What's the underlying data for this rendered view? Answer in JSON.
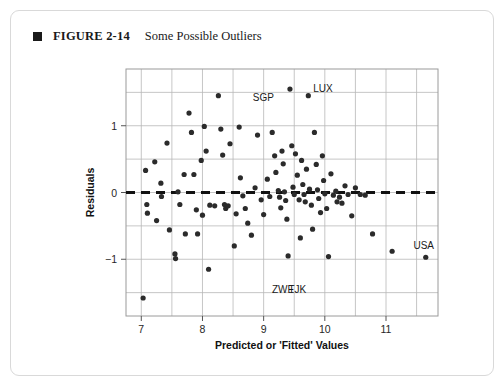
{
  "caption": {
    "bullet_icon": "filled-square-icon",
    "figure_number": "FIGURE 2-14",
    "title": "Some Possible Outliers"
  },
  "chart_data": {
    "type": "scatter",
    "title": "Some Possible Outliers",
    "xlabel": "Predicted or 'Fitted' Values",
    "ylabel": "Residuals",
    "xlim": [
      6.75,
      11.85
    ],
    "ylim": [
      -1.85,
      1.85
    ],
    "xticks": [
      7,
      8,
      9,
      10,
      11
    ],
    "xtick_labels": [
      "7",
      "8",
      "9",
      "10",
      "11"
    ],
    "yticks": [
      1,
      0,
      -1
    ],
    "ytick_labels": [
      "1",
      "0",
      "−1"
    ],
    "grid": true,
    "grid_step_x": 0.5,
    "grid_step_y": 0.5,
    "grid_color": "#b8b8b8",
    "point_color": "#2b2b2b",
    "reference_line": {
      "y": 0,
      "style": "dashed",
      "color": "#111111",
      "width": 3
    },
    "legend": "none",
    "annotations": [
      {
        "label": "SGP",
        "x": 9.43,
        "y": 1.55,
        "label_dx": -16,
        "label_dy": 12
      },
      {
        "label": "LUX",
        "x": 9.73,
        "y": 1.45,
        "label_dx": 5,
        "label_dy": -4
      },
      {
        "label": "USA",
        "x": 11.65,
        "y": -0.97,
        "label_dx": -2,
        "label_dy": -8
      },
      {
        "label": "ZWE",
        "x": 9.35,
        "y": -1.62,
        "label_dx": -2,
        "label_dy": -8
      },
      {
        "label": "TJK",
        "x": 9.55,
        "y": -1.62,
        "label_dx": 0,
        "label_dy": -8
      }
    ],
    "points": [
      [
        7.03,
        -1.58
      ],
      [
        7.07,
        0.33
      ],
      [
        7.09,
        -0.18
      ],
      [
        7.1,
        -0.31
      ],
      [
        7.22,
        0.46
      ],
      [
        7.25,
        -0.42
      ],
      [
        7.32,
        0.14
      ],
      [
        7.33,
        -0.06
      ],
      [
        7.42,
        0.74
      ],
      [
        7.46,
        -0.56
      ],
      [
        7.55,
        -0.92
      ],
      [
        7.56,
        -0.99
      ],
      [
        7.6,
        0.01
      ],
      [
        7.63,
        -0.18
      ],
      [
        7.7,
        0.27
      ],
      [
        7.72,
        -0.62
      ],
      [
        7.78,
        1.19
      ],
      [
        7.82,
        0.9
      ],
      [
        7.86,
        0.27
      ],
      [
        7.9,
        -0.26
      ],
      [
        7.92,
        -0.62
      ],
      [
        7.98,
        0.48
      ],
      [
        8.0,
        -0.34
      ],
      [
        8.03,
        0.99
      ],
      [
        8.06,
        0.62
      ],
      [
        8.1,
        -1.15
      ],
      [
        8.12,
        -0.19
      ],
      [
        8.2,
        -0.2
      ],
      [
        8.26,
        1.45
      ],
      [
        8.3,
        0.95
      ],
      [
        8.33,
        0.56
      ],
      [
        8.36,
        -0.18
      ],
      [
        8.38,
        -0.24
      ],
      [
        8.42,
        -0.2
      ],
      [
        8.45,
        0.73
      ],
      [
        8.52,
        -0.8
      ],
      [
        8.55,
        -0.32
      ],
      [
        8.6,
        0.98
      ],
      [
        8.62,
        0.22
      ],
      [
        8.66,
        -0.05
      ],
      [
        8.7,
        -0.24
      ],
      [
        8.74,
        -0.46
      ],
      [
        8.8,
        -0.64
      ],
      [
        8.86,
        0.07
      ],
      [
        8.9,
        0.86
      ],
      [
        8.96,
        -0.11
      ],
      [
        9.0,
        -0.33
      ],
      [
        9.06,
        0.2
      ],
      [
        9.1,
        -0.06
      ],
      [
        9.14,
        0.9
      ],
      [
        9.18,
        0.55
      ],
      [
        9.2,
        0.3
      ],
      [
        9.24,
        0.03
      ],
      [
        9.26,
        -0.07
      ],
      [
        9.28,
        -0.23
      ],
      [
        9.3,
        0.62
      ],
      [
        9.32,
        0.43
      ],
      [
        9.34,
        0.01
      ],
      [
        9.36,
        -0.12
      ],
      [
        9.38,
        -0.4
      ],
      [
        9.4,
        -0.95
      ],
      [
        9.43,
        1.55
      ],
      [
        9.46,
        0.7
      ],
      [
        9.48,
        0.08
      ],
      [
        9.5,
        -0.03
      ],
      [
        9.52,
        0.58
      ],
      [
        9.55,
        0.26
      ],
      [
        9.58,
        -0.11
      ],
      [
        9.6,
        -0.68
      ],
      [
        9.62,
        0.48
      ],
      [
        9.64,
        0.12
      ],
      [
        9.66,
        -0.03
      ],
      [
        9.68,
        -0.14
      ],
      [
        9.7,
        0.35
      ],
      [
        9.73,
        1.45
      ],
      [
        9.75,
        0.05
      ],
      [
        9.78,
        -0.19
      ],
      [
        9.8,
        -0.55
      ],
      [
        9.83,
        0.9
      ],
      [
        9.86,
        0.42
      ],
      [
        9.88,
        0.04
      ],
      [
        9.9,
        -0.09
      ],
      [
        9.93,
        -0.3
      ],
      [
        9.96,
        0.55
      ],
      [
        9.98,
        0.18
      ],
      [
        10.0,
        -0.02
      ],
      [
        10.03,
        -0.24
      ],
      [
        10.06,
        -0.96
      ],
      [
        10.1,
        0.28
      ],
      [
        10.14,
        -0.04
      ],
      [
        10.18,
        0.02
      ],
      [
        10.2,
        -0.14
      ],
      [
        10.24,
        -0.07
      ],
      [
        10.28,
        -0.16
      ],
      [
        10.33,
        0.1
      ],
      [
        10.38,
        -0.03
      ],
      [
        10.44,
        -0.35
      ],
      [
        10.5,
        0.07
      ],
      [
        10.58,
        -0.03
      ],
      [
        10.66,
        -0.04
      ],
      [
        10.78,
        -0.62
      ],
      [
        11.1,
        -0.88
      ],
      [
        11.65,
        -0.97
      ]
    ]
  }
}
